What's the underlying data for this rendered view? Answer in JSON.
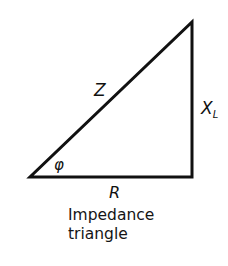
{
  "diagram": {
    "title": "Impedance triangle",
    "caption_lines": [
      "Impedance",
      "triangle"
    ],
    "stroke_color": "#111111",
    "vertices": {
      "bottom_left": [
        30,
        177
      ],
      "bottom_right": [
        192,
        177
      ],
      "top_right": [
        192,
        22
      ]
    },
    "labels": {
      "hypotenuse": "Z",
      "vertical_side_main": "X",
      "vertical_side_sub": "L",
      "horizontal_side": "R",
      "angle": "φ"
    },
    "sides": [
      {
        "name": "hypotenuse",
        "label": "Z",
        "from": "bottom_left",
        "to": "top_right"
      },
      {
        "name": "reactance",
        "label": "X_L",
        "from": "bottom_right",
        "to": "top_right"
      },
      {
        "name": "resistance",
        "label": "R",
        "from": "bottom_left",
        "to": "bottom_right"
      }
    ]
  }
}
